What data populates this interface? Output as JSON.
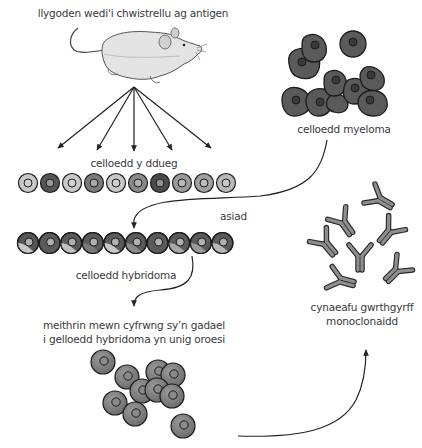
{
  "diagram": {
    "labels": {
      "mouse": "llygoden wedi'i chwistrellu ag antigen",
      "spleen_cells": "celloedd y ddueg",
      "myeloma_cells": "celloedd myeloma",
      "fusion": "asiad",
      "hybridoma_cells": "celloedd hybridoma",
      "culture_line1": "meithrin mewn cyfrwng sy’n gadael",
      "culture_line2": "i gelloedd hybridoma yn unig oroesi",
      "antibodies_line1": "cynaeafu gwrthgyrff",
      "antibodies_line2": "monoclonaidd"
    },
    "colors": {
      "outline": "#222222",
      "myeloma": "#5a5a5a",
      "culture_cell": "#7a7a7a",
      "antibody": "#8a8a8a",
      "text": "#3a3a3a",
      "mouse_body": "#e2e2e2"
    },
    "spleen_cell_shades": [
      "#c8c8c8",
      "#555555",
      "#c8c8c8",
      "#7a7a7a",
      "#c8c8c8",
      "#8a8a8a",
      "#4a4a4a",
      "#9a9a9a",
      "#a0a0a0",
      "#b8b8b8"
    ],
    "hybridoma_cell_shades": [
      [
        "#c8c8c8",
        "#555555"
      ],
      [
        "#5a5a5a",
        "#5a5a5a"
      ],
      [
        "#c0c0c0",
        "#5a5a5a"
      ],
      [
        "#7a7a7a",
        "#5a5a5a"
      ],
      [
        "#c8c8c8",
        "#5a5a5a"
      ],
      [
        "#8a8a8a",
        "#5a5a5a"
      ],
      [
        "#5a5a5a",
        "#5a5a5a"
      ],
      [
        "#a8a8a8",
        "#5a5a5a"
      ],
      [
        "#9a9a9a",
        "#5a5a5a"
      ],
      [
        "#b8b8b8",
        "#5a5a5a"
      ]
    ]
  }
}
